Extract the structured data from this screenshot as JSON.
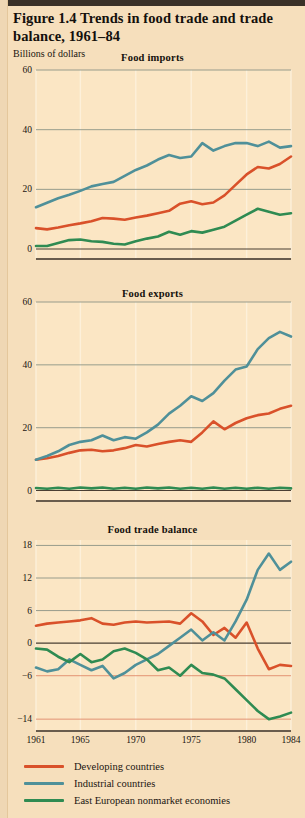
{
  "figure": {
    "title": "Figure 1.4  Trends in food trade and trade balance, 1961–84",
    "units_label": "Billions of dollars"
  },
  "colors": {
    "background": "#f6dfbc",
    "panel_background": "#fbe6c4",
    "developing": "#d9512a",
    "industrial": "#4f9099",
    "east_european": "#2f8b52",
    "gridline": "#8c9486",
    "zero_line": "#4a3f33",
    "axis_line": "#3a3128",
    "text": "#14100c",
    "top_bar": "#3a3128"
  },
  "legend": {
    "position": "below",
    "items": [
      {
        "label": "Developing countries",
        "color_key": "developing"
      },
      {
        "label": "Industrial countries",
        "color_key": "industrial"
      },
      {
        "label": "East European nonmarket economies",
        "color_key": "east_european"
      }
    ]
  },
  "chart_data": [
    {
      "type": "line",
      "title": "Food imports",
      "xlabel": "",
      "ylabel": "Billions of dollars",
      "xlim": [
        1961,
        1984
      ],
      "ylim": [
        -3,
        60
      ],
      "yticks": [
        0,
        20,
        40,
        60
      ],
      "xticks": [
        1961,
        1965,
        1970,
        1975,
        1980,
        1984
      ],
      "grid": true,
      "x": [
        1961,
        1962,
        1963,
        1964,
        1965,
        1966,
        1967,
        1968,
        1969,
        1970,
        1971,
        1972,
        1973,
        1974,
        1975,
        1976,
        1977,
        1978,
        1979,
        1980,
        1981,
        1982,
        1983,
        1984
      ],
      "series": [
        {
          "name": "Developing countries",
          "color_key": "developing",
          "values": [
            7.0,
            6.6,
            7.2,
            8.0,
            8.6,
            9.3,
            10.4,
            10.2,
            9.8,
            10.6,
            11.2,
            12.0,
            12.8,
            15.2,
            16.0,
            15.0,
            15.6,
            18.0,
            21.5,
            25.0,
            27.5,
            27.0,
            28.5,
            31.0
          ]
        },
        {
          "name": "Industrial countries",
          "color_key": "industrial",
          "values": [
            14.0,
            15.5,
            17.0,
            18.2,
            19.5,
            21.0,
            21.8,
            22.5,
            24.5,
            26.5,
            28.0,
            30.0,
            31.5,
            30.5,
            31.0,
            35.5,
            33.0,
            34.5,
            35.5,
            35.5,
            34.5,
            36.0,
            34.0,
            34.5
          ]
        },
        {
          "name": "East European nonmarket economies",
          "color_key": "east_european",
          "values": [
            1.0,
            1.0,
            2.0,
            3.0,
            3.2,
            2.6,
            2.4,
            1.8,
            1.5,
            2.6,
            3.5,
            4.2,
            5.8,
            4.8,
            6.0,
            5.5,
            6.5,
            7.5,
            9.5,
            11.5,
            13.5,
            12.5,
            11.5,
            12.0
          ]
        }
      ]
    },
    {
      "type": "line",
      "title": "Food exports",
      "xlabel": "",
      "ylabel": "Billions of dollars",
      "xlim": [
        1961,
        1984
      ],
      "ylim": [
        -3,
        60
      ],
      "yticks": [
        0,
        20,
        40,
        60
      ],
      "xticks": [
        1961,
        1965,
        1970,
        1975,
        1980,
        1984
      ],
      "grid": true,
      "x": [
        1961,
        1962,
        1963,
        1964,
        1965,
        1966,
        1967,
        1968,
        1969,
        1970,
        1971,
        1972,
        1973,
        1974,
        1975,
        1976,
        1977,
        1978,
        1979,
        1980,
        1981,
        1982,
        1983,
        1984
      ],
      "series": [
        {
          "name": "Developing countries",
          "color_key": "developing",
          "values": [
            9.8,
            10.3,
            11.0,
            12.0,
            12.8,
            13.0,
            12.5,
            12.8,
            13.5,
            14.5,
            14.0,
            14.8,
            15.5,
            16.0,
            15.5,
            18.5,
            22.0,
            19.5,
            21.5,
            23.0,
            24.0,
            24.5,
            26.0,
            27.0
          ]
        },
        {
          "name": "Industrial countries",
          "color_key": "industrial",
          "values": [
            9.8,
            11.0,
            12.5,
            14.5,
            15.5,
            16.0,
            17.5,
            16.0,
            17.0,
            16.5,
            18.5,
            21.0,
            24.5,
            27.0,
            30.0,
            28.5,
            31.0,
            35.0,
            38.5,
            39.5,
            45.0,
            48.5,
            50.5,
            49.0
          ]
        },
        {
          "name": "East European nonmarket economies",
          "color_key": "east_european",
          "values": [
            0.8,
            0.6,
            0.9,
            0.6,
            1.0,
            0.7,
            1.0,
            0.6,
            0.9,
            0.6,
            1.0,
            0.7,
            1.0,
            0.6,
            0.9,
            0.6,
            1.0,
            0.6,
            0.9,
            0.6,
            0.9,
            0.6,
            0.9,
            0.7
          ]
        }
      ]
    },
    {
      "type": "line",
      "title": "Food trade balance",
      "xlabel": "",
      "ylabel": "Billions of dollars",
      "xlim": [
        1961,
        1984
      ],
      "ylim": [
        -16,
        19
      ],
      "yticks": [
        -14,
        -6,
        0,
        6,
        12,
        18
      ],
      "xticks": [
        1961,
        1965,
        1970,
        1975,
        1980,
        1984
      ],
      "grid": true,
      "x": [
        1961,
        1962,
        1963,
        1964,
        1965,
        1966,
        1967,
        1968,
        1969,
        1970,
        1971,
        1972,
        1973,
        1974,
        1975,
        1976,
        1977,
        1978,
        1979,
        1980,
        1981,
        1982,
        1983,
        1984
      ],
      "series": [
        {
          "name": "Developing countries",
          "color_key": "developing",
          "values": [
            3.2,
            3.6,
            3.8,
            4.0,
            4.2,
            4.6,
            3.6,
            3.4,
            3.8,
            4.0,
            3.8,
            3.9,
            4.0,
            3.6,
            5.5,
            4.0,
            1.5,
            2.8,
            1.0,
            3.8,
            -1.0,
            -4.8,
            -4.0,
            -4.2
          ]
        },
        {
          "name": "Industrial countries",
          "color_key": "industrial",
          "values": [
            -4.5,
            -5.2,
            -4.8,
            -3.0,
            -4.0,
            -5.0,
            -4.2,
            -6.5,
            -5.5,
            -4.0,
            -3.0,
            -2.0,
            -0.5,
            1.0,
            2.5,
            0.5,
            2.0,
            0.5,
            4.0,
            8.0,
            13.5,
            16.5,
            13.5,
            15.0
          ]
        },
        {
          "name": "East European nonmarket economies",
          "color_key": "east_european",
          "values": [
            -1.0,
            -1.2,
            -2.5,
            -3.5,
            -2.0,
            -3.5,
            -3.0,
            -1.5,
            -1.0,
            -1.8,
            -3.0,
            -5.0,
            -4.5,
            -6.0,
            -4.0,
            -5.5,
            -5.8,
            -6.5,
            -8.5,
            -10.5,
            -12.5,
            -14.0,
            -13.5,
            -12.8
          ]
        }
      ]
    }
  ]
}
